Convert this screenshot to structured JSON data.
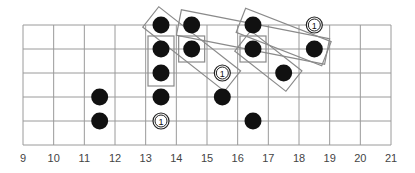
{
  "diagram": {
    "type": "guitar-fretboard",
    "strings": 6,
    "fret_start": 9,
    "fret_end": 21,
    "fret_labels": [
      "9",
      "10",
      "11",
      "12",
      "13",
      "14",
      "15",
      "16",
      "17",
      "18",
      "19",
      "20",
      "21"
    ],
    "colors": {
      "grid": "#9a9a9a",
      "dot": "#111111",
      "box": "#8a8a8a"
    },
    "dots": [
      {
        "string": 0,
        "fret": 13.5,
        "type": "note"
      },
      {
        "string": 0,
        "fret": 14.5,
        "type": "note"
      },
      {
        "string": 0,
        "fret": 16.5,
        "type": "note"
      },
      {
        "string": 0,
        "fret": 18.5,
        "type": "root",
        "label": "1"
      },
      {
        "string": 1,
        "fret": 13.5,
        "type": "note"
      },
      {
        "string": 1,
        "fret": 14.5,
        "type": "note"
      },
      {
        "string": 1,
        "fret": 16.5,
        "type": "note"
      },
      {
        "string": 1,
        "fret": 18.5,
        "type": "note"
      },
      {
        "string": 2,
        "fret": 13.5,
        "type": "note"
      },
      {
        "string": 2,
        "fret": 15.5,
        "type": "root",
        "label": "1"
      },
      {
        "string": 2,
        "fret": 17.5,
        "type": "note"
      },
      {
        "string": 3,
        "fret": 11.5,
        "type": "note"
      },
      {
        "string": 3,
        "fret": 13.5,
        "type": "note"
      },
      {
        "string": 3,
        "fret": 15.5,
        "type": "note"
      },
      {
        "string": 4,
        "fret": 11.5,
        "type": "note"
      },
      {
        "string": 4,
        "fret": 13.5,
        "type": "root",
        "label": "1"
      },
      {
        "string": 4,
        "fret": 16.5,
        "type": "note"
      }
    ],
    "boxes": [
      {
        "name": "vertical-box-fret-13",
        "from": [
          1,
          13.5
        ],
        "to": [
          2,
          13.5
        ]
      },
      {
        "name": "diagonal-box-13-15",
        "from": [
          0,
          13.5
        ],
        "to": [
          2,
          15.5
        ]
      },
      {
        "name": "diagonal-box-14-18",
        "from": [
          0,
          14.5
        ],
        "to": [
          1,
          18.5
        ]
      },
      {
        "name": "square-box-14",
        "from": [
          1,
          14.5
        ],
        "to": [
          1,
          14.5
        ]
      },
      {
        "name": "diagonal-box-16-17",
        "from": [
          1,
          16.5
        ],
        "to": [
          2,
          17.5
        ]
      },
      {
        "name": "diagonal-box-16-18",
        "from": [
          0,
          16.5
        ],
        "to": [
          1,
          18.5
        ]
      },
      {
        "name": "square-box-16",
        "from": [
          1,
          16.5
        ],
        "to": [
          1,
          16.5
        ]
      }
    ]
  }
}
